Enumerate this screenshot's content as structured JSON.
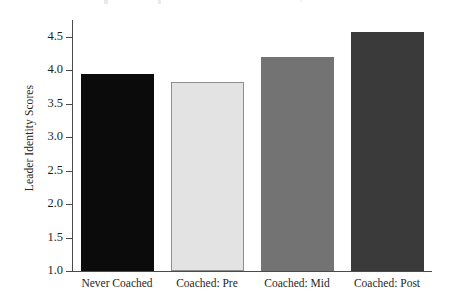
{
  "figure": {
    "background_color": "#ffffff",
    "axis_color": "#4a4a4a"
  },
  "chart_data": {
    "type": "bar",
    "title": "",
    "subtitle": "",
    "xlabel": "",
    "ylabel": "Leader Identity Scores",
    "categories": [
      "Never Coached",
      "Coached: Pre",
      "Coached: Mid",
      "Coached: Post"
    ],
    "values": [
      3.95,
      3.82,
      4.2,
      4.57
    ],
    "bar_colors": [
      "#0b0b0b",
      "#e3e3e3",
      "#737373",
      "#3a3a3a"
    ],
    "ylim": [
      1.0,
      4.75
    ],
    "y_ticks": [
      1.0,
      1.5,
      2.0,
      2.5,
      3.0,
      3.5,
      4.0,
      4.5
    ],
    "y_tick_labels": [
      "1.0",
      "1.5",
      "2.0",
      "2.5",
      "3.0",
      "3.5",
      "4.0",
      "4.5"
    ],
    "grid": false,
    "legend": false,
    "legend_position": "none",
    "series": [
      {
        "name": "Leader Identity Scores",
        "values": [
          3.95,
          3.82,
          4.2,
          4.57
        ]
      }
    ]
  }
}
